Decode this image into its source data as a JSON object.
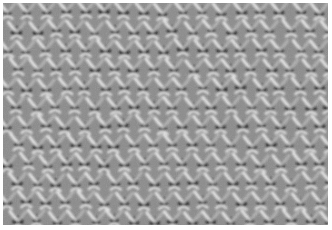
{
  "image": {
    "subject": "Close-up of knitted fabric texture (lace/eyelet stitch pattern)",
    "colors": {
      "base": "#8a8a8a",
      "highlight": "#e6e6e6",
      "mid": "#b0b0b0",
      "shadow": "#1a1a1a"
    },
    "grid": {
      "columns": 17,
      "rows": 12,
      "cell_width": 19.5,
      "cell_height": 19
    }
  }
}
